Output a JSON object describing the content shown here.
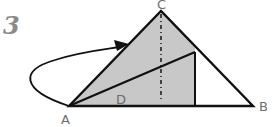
{
  "step": {
    "number": "3"
  },
  "diagram": {
    "labels": {
      "apex": "C",
      "left": "A",
      "right": "B",
      "inner": "D"
    },
    "colors": {
      "fill": "#c8c8c8",
      "stroke": "#111111",
      "label": "#6d6d6d",
      "step_number": "#8a8a8a"
    },
    "points": {
      "A": [
        69,
        106
      ],
      "B": [
        253,
        106
      ],
      "C": [
        161,
        11
      ],
      "fold_top": [
        195,
        52
      ],
      "fold_bottom": [
        195,
        106
      ]
    },
    "arrow": {
      "description": "curved arrow from A looping left then up to the left edge of AC"
    }
  }
}
